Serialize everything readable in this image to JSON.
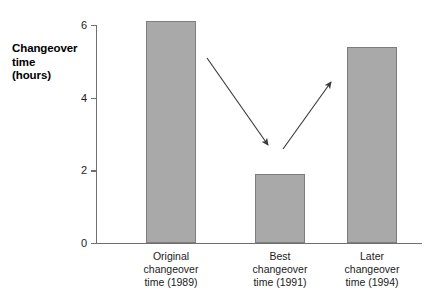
{
  "chart_data": {
    "type": "bar",
    "title": "",
    "xlabel": "",
    "ylabel": "Changeover time (hours)",
    "ylabel_lines": [
      "Changeover",
      "time",
      "(hours)"
    ],
    "categories": [
      "Original changeover time (1989)",
      "Best changeover time (1991)",
      "Later changeover time (1994)"
    ],
    "category_lines": [
      [
        "Original",
        "changeover",
        "time (1989)"
      ],
      [
        "Best",
        "changeover",
        "time (1991)"
      ],
      [
        "Later",
        "changeover",
        "time (1994)"
      ]
    ],
    "values": [
      6.1,
      1.9,
      5.4
    ],
    "ylim": [
      0,
      6.4
    ],
    "yticks": [
      0,
      2,
      4,
      6
    ],
    "ytick_labels": [
      "0",
      "2",
      "4",
      "6"
    ],
    "grid": false,
    "legend": false,
    "bar_color": "#a9a9a9",
    "bar_border_color": "#7d7d7d",
    "axis_color": "#6f6f6f",
    "text_color": "#1a1a1a",
    "background": "#ffffff",
    "annotations": [
      {
        "name": "arrow-decrease",
        "from": [
          207,
          58
        ],
        "to": [
          268,
          145
        ],
        "direction": "down-right",
        "color": "#3a3a3a"
      },
      {
        "name": "arrow-increase",
        "from": [
          283,
          149
        ],
        "to": [
          331,
          82
        ],
        "direction": "up-right",
        "color": "#3a3a3a"
      }
    ]
  }
}
